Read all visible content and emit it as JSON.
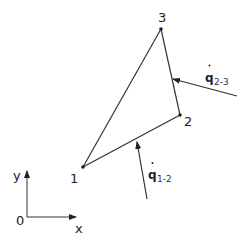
{
  "diagram": {
    "type": "triangular element with heat flux on edges",
    "nodes": [
      {
        "id": "1",
        "label": "1",
        "x": 83,
        "y": 167
      },
      {
        "id": "2",
        "label": "2",
        "x": 180,
        "y": 115
      },
      {
        "id": "3",
        "label": "3",
        "x": 161,
        "y": 29
      }
    ],
    "edges": [
      {
        "from": "1",
        "to": "2"
      },
      {
        "from": "2",
        "to": "3"
      },
      {
        "from": "3",
        "to": "1"
      }
    ],
    "fluxes": [
      {
        "symbol": "q",
        "subscript": "2-3",
        "label": "q̇ 2-3",
        "edge": "2-3"
      },
      {
        "symbol": "q",
        "subscript": "1-2",
        "label": "q̇ 1-2",
        "edge": "1-2"
      }
    ],
    "axes": {
      "origin_label": "0",
      "x_label": "x",
      "y_label": "y"
    },
    "colors": {
      "line": "#333333",
      "text": "#222222",
      "background": "#ffffff"
    }
  }
}
